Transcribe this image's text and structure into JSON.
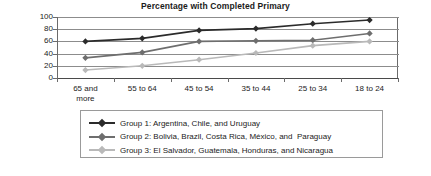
{
  "chart_data": {
    "type": "line",
    "title": "Percentage with Completed Primary",
    "xlabel": "",
    "ylabel": "",
    "ylim": [
      0,
      100
    ],
    "yticks": [
      0,
      20,
      40,
      60,
      80,
      100
    ],
    "grid": true,
    "legend_position": "bottom",
    "categories": [
      "65 and\nmore",
      "55 to 64",
      "45 to 54",
      "35 to 44",
      "25 to 34",
      "18 to 24"
    ],
    "series": [
      {
        "name": "Group 1: Argentina, Chile, and Uruguay",
        "color": "#2b2b2b",
        "values": [
          60,
          65,
          78,
          81,
          89,
          95
        ]
      },
      {
        "name": "Group 2: Bolivia, Brazil, Costa Rica, México, and  Paraguay",
        "color": "#6e6e6e",
        "values": [
          33,
          42,
          60,
          61,
          62,
          73
        ]
      },
      {
        "name": "Group 3: El Salvador, Guatemala, Honduras, and Nicaragua",
        "color": "#b9b9b9",
        "values": [
          13,
          20,
          30,
          41,
          53,
          60
        ]
      }
    ]
  }
}
